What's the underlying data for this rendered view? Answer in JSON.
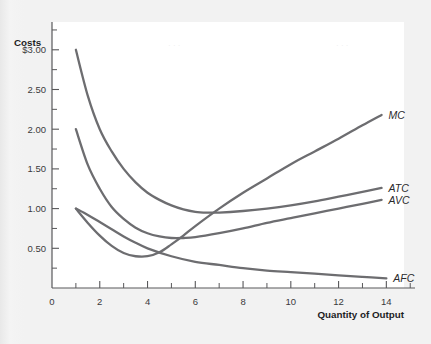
{
  "chart_data": {
    "type": "line",
    "title": "",
    "xlabel": "Quantity of Output",
    "ylabel": "Costs",
    "xlim": [
      0,
      15.2
    ],
    "ylim": [
      0,
      3.35
    ],
    "grid": false,
    "legend_position": "right-of-curve-ends",
    "x_ticks_major": [
      0,
      2,
      4,
      6,
      8,
      10,
      12,
      14
    ],
    "x_ticks_minor": [
      1,
      3,
      5,
      7,
      9,
      11,
      13,
      15
    ],
    "x_tick_labels": [
      "0",
      "2",
      "4",
      "6",
      "8",
      "10",
      "12",
      "14"
    ],
    "y_ticks_major": [
      0.5,
      1.0,
      1.5,
      2.0,
      2.5,
      3.0
    ],
    "y_ticks_minor": [
      0.25,
      0.75,
      1.25,
      1.75,
      2.25,
      2.75,
      3.25
    ],
    "y_tick_labels": [
      "0.50",
      "1.00",
      "1.50",
      "2.00",
      "2.50",
      "$3.00"
    ],
    "series": [
      {
        "name": "MC",
        "label": "MC",
        "x": [
          1,
          1.5,
          2,
          2.5,
          3,
          3.5,
          4,
          4.5,
          5,
          5.5,
          6,
          7,
          8,
          9,
          10,
          11,
          12,
          13,
          13.8
        ],
        "values": [
          1.0,
          0.82,
          0.66,
          0.53,
          0.44,
          0.4,
          0.4,
          0.45,
          0.55,
          0.66,
          0.78,
          1.0,
          1.2,
          1.38,
          1.56,
          1.72,
          1.88,
          2.05,
          2.18
        ]
      },
      {
        "name": "ATC",
        "label": "ATC",
        "x": [
          1,
          1.5,
          2,
          2.5,
          3,
          3.5,
          4,
          4.5,
          5,
          5.5,
          6,
          6.5,
          7,
          8,
          9,
          10,
          11,
          12,
          13,
          13.8
        ],
        "values": [
          3.0,
          2.42,
          2.0,
          1.72,
          1.5,
          1.33,
          1.2,
          1.11,
          1.04,
          0.99,
          0.96,
          0.95,
          0.95,
          0.97,
          1.0,
          1.04,
          1.09,
          1.15,
          1.21,
          1.26
        ]
      },
      {
        "name": "AVC",
        "label": "AVC",
        "x": [
          1,
          1.5,
          2,
          2.5,
          3,
          3.5,
          4,
          4.5,
          5,
          5.5,
          6,
          7,
          8,
          9,
          10,
          11,
          12,
          13,
          13.8
        ],
        "values": [
          2.0,
          1.55,
          1.25,
          1.02,
          0.87,
          0.76,
          0.69,
          0.65,
          0.63,
          0.63,
          0.64,
          0.69,
          0.75,
          0.82,
          0.88,
          0.94,
          1.0,
          1.06,
          1.11
        ]
      },
      {
        "name": "AFC",
        "label": "AFC",
        "x": [
          1,
          1.5,
          2,
          2.5,
          3,
          3.5,
          4,
          5,
          6,
          7,
          8,
          9,
          10,
          11,
          12,
          13,
          14
        ],
        "values": [
          1.0,
          0.92,
          0.83,
          0.74,
          0.65,
          0.57,
          0.5,
          0.4,
          0.33,
          0.29,
          0.25,
          0.22,
          0.2,
          0.18,
          0.16,
          0.14,
          0.12
        ]
      }
    ],
    "colors": {
      "curve": "#6d6d70",
      "axis": "#58585a",
      "text": "#1d1d1f",
      "plot_background": "#ffffff",
      "page_background": "#f2f2f2"
    }
  }
}
